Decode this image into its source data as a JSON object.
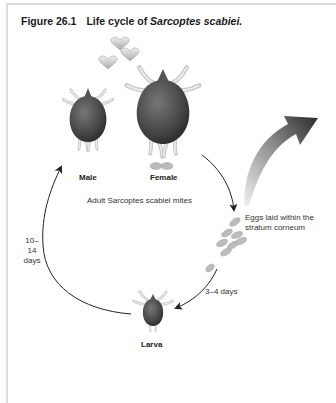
{
  "figure": {
    "number": "Figure 26.1",
    "title_prefix": "Life cycle of ",
    "title_species": "Sarcoptes scabiei."
  },
  "labels": {
    "male": "Male",
    "female": "Female",
    "adults": "Adult Sarcoptes scabiei mites",
    "eggs": "Eggs laid within the stratum corneum",
    "egg_to_larva": "3–4 days",
    "larva_to_adult": "10–14 days",
    "larva": "Larva"
  },
  "stages": [
    {
      "id": "adult-male",
      "label": "Male"
    },
    {
      "id": "adult-female",
      "label": "Female"
    },
    {
      "id": "eggs",
      "label": "Eggs laid within the stratum corneum"
    },
    {
      "id": "larva",
      "label": "Larva"
    }
  ],
  "transitions": [
    {
      "from": "adult-female",
      "to": "eggs",
      "duration": ""
    },
    {
      "from": "eggs",
      "to": "larva",
      "duration": "3–4 days"
    },
    {
      "from": "larva",
      "to": "adult-male",
      "duration": "10–14 days"
    }
  ],
  "colors": {
    "mite_body": "#4a4a4a",
    "mite_legs": "#d0d0d0",
    "eggs": "#b8b8b8",
    "hearts": "#c8c8c8",
    "arrow": "#222222",
    "big_arrow": "#3a3a3a"
  }
}
